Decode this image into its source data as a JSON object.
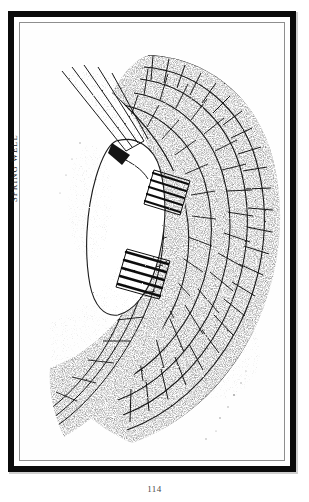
{
  "page": {
    "folio": "114",
    "medium": "pen-and-ink line drawing, scanned book plate",
    "background_color": "#ffffff",
    "ink_color": "#111111"
  },
  "frame": {
    "outer_border_color": "#0b0b0b",
    "inner_rule_color": "#8e8e8e",
    "plate_background": "#fefefe"
  },
  "caption": {
    "text": "SPRING WELL",
    "orientation": "rotated-90-ccw",
    "color": "#1a1a1a"
  },
  "illustration": {
    "subject": "spring well corbelled stone masonry",
    "title": "SPRING WELL",
    "elements": [
      {
        "name": "well-opening",
        "description": "blank white cavity at centre-left"
      },
      {
        "name": "masonry-arc-outer",
        "description": "radiating voussoir blocks forming outer curve"
      },
      {
        "name": "masonry-arc-inner",
        "description": "second concentric course of blocks"
      },
      {
        "name": "masonry-coursing-lower",
        "description": "rectangular coursed stonework sweeping lower-left"
      },
      {
        "name": "timber-beams",
        "description": "diagonal beam lines at upper left"
      },
      {
        "name": "dark-block-upper",
        "description": "heavily hatched dark stone group"
      },
      {
        "name": "dark-block-lower",
        "description": "second heavily hatched dark stone group"
      }
    ]
  }
}
